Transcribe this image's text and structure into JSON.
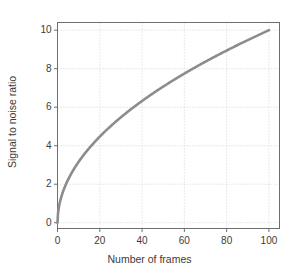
{
  "chart_data": {
    "type": "line",
    "title": "",
    "xlabel": "Number of frames",
    "ylabel": "Signal to noise ratio",
    "xlim": [
      0,
      105
    ],
    "ylim": [
      -0.3,
      10.4
    ],
    "xticks": [
      0,
      20,
      40,
      60,
      80,
      100
    ],
    "xtick_labels": [
      "0",
      "20",
      "40",
      "60",
      "80",
      "100"
    ],
    "yticks": [
      0,
      2,
      4,
      6,
      8,
      10
    ],
    "ytick_labels": [
      "0",
      "2",
      "4",
      "6",
      "8",
      "10"
    ],
    "grid": true,
    "grid_style": "dotted",
    "legend": null,
    "series": [
      {
        "name": "Signal to noise ratio",
        "relation": "snr = sqrt(frames)",
        "color": "#8c8c8c",
        "line_width": 2.6,
        "x": [
          0,
          1,
          2,
          3,
          4,
          5,
          6,
          8,
          10,
          12,
          15,
          20,
          25,
          30,
          35,
          40,
          45,
          50,
          55,
          60,
          65,
          70,
          75,
          80,
          85,
          90,
          95,
          100
        ],
        "y": [
          0,
          1,
          1.41,
          1.73,
          2,
          2.24,
          2.45,
          2.83,
          3.16,
          3.46,
          3.87,
          4.47,
          5,
          5.48,
          5.92,
          6.32,
          6.71,
          7.07,
          7.42,
          7.75,
          8.06,
          8.37,
          8.66,
          8.94,
          9.22,
          9.49,
          9.75,
          10
        ]
      }
    ]
  },
  "style": {
    "background": "#ffffff",
    "frame_color": "#6e6e6e",
    "grid_color": "#c9c9c9",
    "text_color": "#3b3b3b",
    "curve_color": "#8c8c8c"
  }
}
